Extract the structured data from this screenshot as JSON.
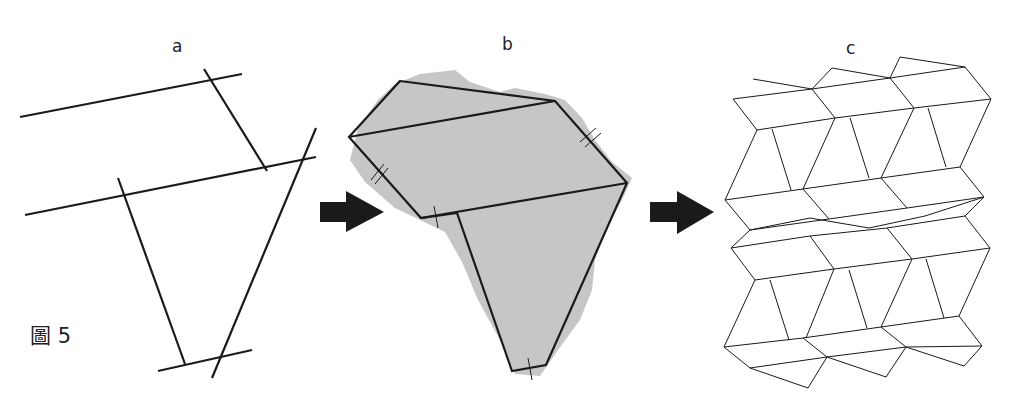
{
  "panels": [
    {
      "label": "a"
    },
    {
      "label": "b"
    },
    {
      "label": "c"
    }
  ],
  "figure_caption": "圖 5",
  "colors": {
    "line": "#1a1a1a",
    "land": "#c8c8c8",
    "arrow": "#1a1a1a"
  }
}
